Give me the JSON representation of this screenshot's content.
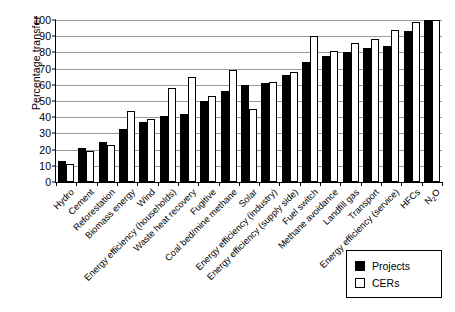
{
  "chart_data": {
    "type": "bar",
    "title": "",
    "xlabel": "",
    "ylabel": "Percentage transfer",
    "ylim": [
      0,
      100
    ],
    "yticks": [
      0,
      10,
      20,
      30,
      40,
      50,
      60,
      70,
      80,
      90,
      100
    ],
    "grid": true,
    "legend_position": "bottom-right",
    "categories": [
      "Hydro",
      "Cement",
      "Reforestation",
      "Biomass energy",
      "Wind",
      "Energy efficiency (households)",
      "Waste heat recovery",
      "Fugitive",
      "Coal bed/mine methane",
      "Solar",
      "Energy efficiency (industry)",
      "Energy efficiency (supply side)",
      "Fuel switch",
      "Methane avoidance",
      "Landfill gas",
      "Transport",
      "Energy efficiency (service)",
      "HFCs",
      "N2O"
    ],
    "series": [
      {
        "name": "Projects",
        "color": "#000000",
        "values": [
          13,
          21,
          25,
          33,
          37,
          41,
          42,
          50,
          56,
          60,
          61,
          66,
          74,
          78,
          80,
          83,
          84,
          93,
          100
        ]
      },
      {
        "name": "CERs",
        "color": "#ffffff",
        "values": [
          11,
          19,
          23,
          44,
          39,
          58,
          65,
          53,
          69,
          45,
          62,
          68,
          90,
          81,
          86,
          88,
          94,
          99,
          100
        ]
      }
    ]
  },
  "legend": {
    "items": [
      {
        "label": "Projects",
        "style": "filled"
      },
      {
        "label": "CERs",
        "style": "outline"
      }
    ]
  },
  "axis": {
    "y_title": "Percentage transfer"
  }
}
